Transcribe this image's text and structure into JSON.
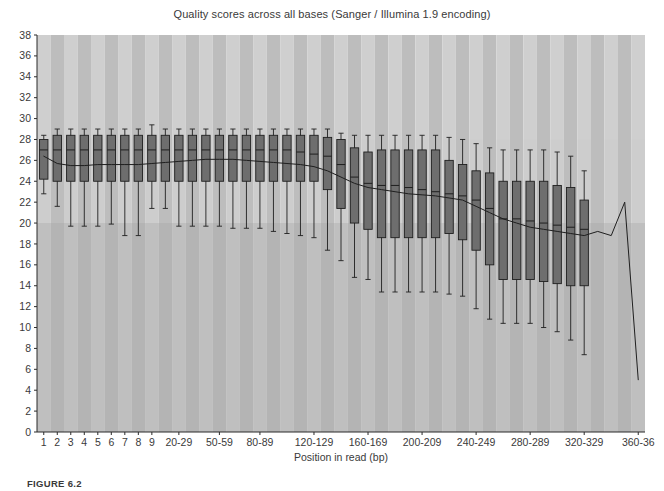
{
  "figure": {
    "caption": "FIGURE 6.2"
  },
  "chart_data": {
    "type": "bar",
    "subtype": "boxplot",
    "title": "Quality scores across all bases (Sanger / Illumina 1.9 encoding)",
    "xlabel": "Position in read (bp)",
    "ylabel": "",
    "ylim": [
      0,
      38
    ],
    "yticks": [
      0,
      2,
      4,
      6,
      8,
      10,
      12,
      14,
      16,
      18,
      20,
      22,
      24,
      26,
      28,
      30,
      32,
      34,
      36,
      38
    ],
    "grid": false,
    "legend": "none",
    "background_bands": [
      {
        "name": "good-quality-band",
        "from": 28,
        "to": 38,
        "color": "#d2d2d2"
      },
      {
        "name": "medium-quality-band",
        "from": 20,
        "to": 28,
        "color": "#c6c6c6"
      },
      {
        "name": "poor-quality-band",
        "from": 0,
        "to": 20,
        "color": "#a8a8a8"
      }
    ],
    "column_stripe_colors": [
      "#cfcfcf",
      "#bdbdbd"
    ],
    "box_fill_color": "#6e6e6e",
    "box_line_color": "#1f1f1f",
    "mean_line_color": "#1f1f1f",
    "categories": [
      "1",
      "2",
      "3",
      "4",
      "5",
      "6",
      "7",
      "8",
      "9",
      "10-19",
      "20-29",
      "30-39",
      "40-49",
      "50-59",
      "60-69",
      "70-79",
      "80-89",
      "90-99",
      "100-109",
      "110-119",
      "120-129",
      "130-139",
      "140-149",
      "150-159",
      "160-169",
      "170-179",
      "180-189",
      "190-199",
      "200-209",
      "210-219",
      "220-229",
      "230-239",
      "240-249",
      "250-259",
      "260-269",
      "270-279",
      "280-289",
      "290-299",
      "300-309",
      "310-319",
      "320-329",
      "330-339",
      "340-349",
      "350-359",
      "360-36"
    ],
    "xtick_labels": [
      {
        "category": "1",
        "label": "1"
      },
      {
        "category": "2",
        "label": "2"
      },
      {
        "category": "3",
        "label": "3"
      },
      {
        "category": "4",
        "label": "4"
      },
      {
        "category": "5",
        "label": "5"
      },
      {
        "category": "6",
        "label": "6"
      },
      {
        "category": "7",
        "label": "7"
      },
      {
        "category": "8",
        "label": "8"
      },
      {
        "category": "9",
        "label": "9"
      },
      {
        "category": "20-29",
        "label": "20-29"
      },
      {
        "category": "50-59",
        "label": "50-59"
      },
      {
        "category": "80-89",
        "label": "80-89"
      },
      {
        "category": "120-129",
        "label": "120-129"
      },
      {
        "category": "160-169",
        "label": "160-169"
      },
      {
        "category": "200-209",
        "label": "200-209"
      },
      {
        "category": "240-249",
        "label": "240-249"
      },
      {
        "category": "280-289",
        "label": "280-289"
      },
      {
        "category": "320-329",
        "label": "320-329"
      },
      {
        "category": "360-36",
        "label": "360-36"
      }
    ],
    "boxes": [
      {
        "category": "1",
        "lower_whisker": 22.8,
        "q1": 24.2,
        "median": 27.0,
        "q3": 28.0,
        "upper_whisker": 28.4
      },
      {
        "category": "2",
        "lower_whisker": 21.6,
        "q1": 24.0,
        "median": 27.0,
        "q3": 28.4,
        "upper_whisker": 29.0
      },
      {
        "category": "3",
        "lower_whisker": 19.7,
        "q1": 24.0,
        "median": 27.0,
        "q3": 28.4,
        "upper_whisker": 29.0
      },
      {
        "category": "4",
        "lower_whisker": 19.7,
        "q1": 24.0,
        "median": 27.0,
        "q3": 28.4,
        "upper_whisker": 29.0
      },
      {
        "category": "5",
        "lower_whisker": 19.7,
        "q1": 24.0,
        "median": 27.0,
        "q3": 28.4,
        "upper_whisker": 29.0
      },
      {
        "category": "6",
        "lower_whisker": 19.9,
        "q1": 24.0,
        "median": 27.0,
        "q3": 28.4,
        "upper_whisker": 29.0
      },
      {
        "category": "7",
        "lower_whisker": 18.8,
        "q1": 24.0,
        "median": 27.0,
        "q3": 28.4,
        "upper_whisker": 29.0
      },
      {
        "category": "8",
        "lower_whisker": 18.8,
        "q1": 24.0,
        "median": 27.0,
        "q3": 28.4,
        "upper_whisker": 29.0
      },
      {
        "category": "9",
        "lower_whisker": 21.4,
        "q1": 24.0,
        "median": 27.0,
        "q3": 28.4,
        "upper_whisker": 29.4
      },
      {
        "category": "10-19",
        "lower_whisker": 21.4,
        "q1": 24.0,
        "median": 27.0,
        "q3": 28.4,
        "upper_whisker": 29.0
      },
      {
        "category": "20-29",
        "lower_whisker": 19.7,
        "q1": 24.0,
        "median": 27.0,
        "q3": 28.4,
        "upper_whisker": 29.0
      },
      {
        "category": "30-39",
        "lower_whisker": 19.7,
        "q1": 24.0,
        "median": 27.0,
        "q3": 28.4,
        "upper_whisker": 29.0
      },
      {
        "category": "40-49",
        "lower_whisker": 19.7,
        "q1": 24.0,
        "median": 27.0,
        "q3": 28.4,
        "upper_whisker": 29.0
      },
      {
        "category": "50-59",
        "lower_whisker": 19.7,
        "q1": 24.0,
        "median": 27.0,
        "q3": 28.4,
        "upper_whisker": 29.0
      },
      {
        "category": "60-69",
        "lower_whisker": 19.5,
        "q1": 24.0,
        "median": 27.0,
        "q3": 28.4,
        "upper_whisker": 29.0
      },
      {
        "category": "70-79",
        "lower_whisker": 19.5,
        "q1": 24.0,
        "median": 27.0,
        "q3": 28.4,
        "upper_whisker": 29.0
      },
      {
        "category": "80-89",
        "lower_whisker": 19.5,
        "q1": 24.0,
        "median": 27.0,
        "q3": 28.4,
        "upper_whisker": 29.0
      },
      {
        "category": "90-99",
        "lower_whisker": 19.2,
        "q1": 24.0,
        "median": 27.0,
        "q3": 28.4,
        "upper_whisker": 29.0
      },
      {
        "category": "100-109",
        "lower_whisker": 19.0,
        "q1": 24.0,
        "median": 27.0,
        "q3": 28.4,
        "upper_whisker": 29.0
      },
      {
        "category": "110-119",
        "lower_whisker": 18.8,
        "q1": 24.0,
        "median": 26.8,
        "q3": 28.4,
        "upper_whisker": 29.0
      },
      {
        "category": "120-129",
        "lower_whisker": 18.6,
        "q1": 24.0,
        "median": 26.6,
        "q3": 28.4,
        "upper_whisker": 29.0
      },
      {
        "category": "130-139",
        "lower_whisker": 17.4,
        "q1": 23.2,
        "median": 26.4,
        "q3": 28.2,
        "upper_whisker": 29.0
      },
      {
        "category": "140-149",
        "lower_whisker": 16.4,
        "q1": 21.4,
        "median": 25.6,
        "q3": 28.0,
        "upper_whisker": 28.6
      },
      {
        "category": "150-159",
        "lower_whisker": 14.8,
        "q1": 20.0,
        "median": 24.4,
        "q3": 27.2,
        "upper_whisker": 28.4
      },
      {
        "category": "160-169",
        "lower_whisker": 14.6,
        "q1": 19.4,
        "median": 23.8,
        "q3": 26.8,
        "upper_whisker": 28.4
      },
      {
        "category": "170-179",
        "lower_whisker": 13.4,
        "q1": 18.6,
        "median": 23.6,
        "q3": 27.0,
        "upper_whisker": 28.4
      },
      {
        "category": "180-189",
        "lower_whisker": 13.4,
        "q1": 18.6,
        "median": 23.6,
        "q3": 27.0,
        "upper_whisker": 28.4
      },
      {
        "category": "190-199",
        "lower_whisker": 13.4,
        "q1": 18.6,
        "median": 23.4,
        "q3": 27.0,
        "upper_whisker": 28.4
      },
      {
        "category": "200-209",
        "lower_whisker": 13.4,
        "q1": 18.6,
        "median": 23.2,
        "q3": 27.0,
        "upper_whisker": 28.4
      },
      {
        "category": "210-219",
        "lower_whisker": 13.4,
        "q1": 18.6,
        "median": 23.0,
        "q3": 27.0,
        "upper_whisker": 28.4
      },
      {
        "category": "220-229",
        "lower_whisker": 13.2,
        "q1": 19.0,
        "median": 22.8,
        "q3": 26.0,
        "upper_whisker": 28.2
      },
      {
        "category": "230-239",
        "lower_whisker": 13.0,
        "q1": 18.4,
        "median": 22.6,
        "q3": 25.6,
        "upper_whisker": 28.0
      },
      {
        "category": "240-249",
        "lower_whisker": 11.8,
        "q1": 17.4,
        "median": 22.2,
        "q3": 25.0,
        "upper_whisker": 27.6
      },
      {
        "category": "250-259",
        "lower_whisker": 10.8,
        "q1": 16.0,
        "median": 21.4,
        "q3": 24.8,
        "upper_whisker": 27.2
      },
      {
        "category": "260-269",
        "lower_whisker": 10.4,
        "q1": 14.6,
        "median": 20.4,
        "q3": 24.0,
        "upper_whisker": 27.0
      },
      {
        "category": "270-279",
        "lower_whisker": 10.4,
        "q1": 14.6,
        "median": 20.4,
        "q3": 24.0,
        "upper_whisker": 27.0
      },
      {
        "category": "280-289",
        "lower_whisker": 10.4,
        "q1": 14.6,
        "median": 20.2,
        "q3": 24.0,
        "upper_whisker": 27.0
      },
      {
        "category": "290-299",
        "lower_whisker": 10.0,
        "q1": 14.4,
        "median": 20.0,
        "q3": 24.0,
        "upper_whisker": 27.0
      },
      {
        "category": "300-309",
        "lower_whisker": 9.6,
        "q1": 14.2,
        "median": 19.8,
        "q3": 23.6,
        "upper_whisker": 26.8
      },
      {
        "category": "310-319",
        "lower_whisker": 8.8,
        "q1": 14.0,
        "median": 19.6,
        "q3": 23.4,
        "upper_whisker": 26.4
      },
      {
        "category": "320-329",
        "lower_whisker": 7.4,
        "q1": 14.0,
        "median": 19.4,
        "q3": 22.2,
        "upper_whisker": 25.0
      }
    ],
    "mean_line": {
      "name": "mean-quality-line",
      "points": [
        {
          "category": "1",
          "value": 26.4
        },
        {
          "category": "2",
          "value": 25.7
        },
        {
          "category": "3",
          "value": 25.5
        },
        {
          "category": "4",
          "value": 25.5
        },
        {
          "category": "5",
          "value": 25.6
        },
        {
          "category": "6",
          "value": 25.6
        },
        {
          "category": "7",
          "value": 25.6
        },
        {
          "category": "8",
          "value": 25.6
        },
        {
          "category": "9",
          "value": 25.7
        },
        {
          "category": "10-19",
          "value": 25.8
        },
        {
          "category": "20-29",
          "value": 25.9
        },
        {
          "category": "30-39",
          "value": 26.0
        },
        {
          "category": "40-49",
          "value": 26.1
        },
        {
          "category": "50-59",
          "value": 26.1
        },
        {
          "category": "60-69",
          "value": 26.1
        },
        {
          "category": "70-79",
          "value": 26.0
        },
        {
          "category": "80-89",
          "value": 25.9
        },
        {
          "category": "90-99",
          "value": 25.8
        },
        {
          "category": "100-109",
          "value": 25.7
        },
        {
          "category": "110-119",
          "value": 25.6
        },
        {
          "category": "120-129",
          "value": 25.4
        },
        {
          "category": "130-139",
          "value": 25.0
        },
        {
          "category": "140-149",
          "value": 24.4
        },
        {
          "category": "150-159",
          "value": 23.8
        },
        {
          "category": "160-169",
          "value": 23.4
        },
        {
          "category": "170-179",
          "value": 23.2
        },
        {
          "category": "180-189",
          "value": 23.0
        },
        {
          "category": "190-199",
          "value": 22.8
        },
        {
          "category": "200-209",
          "value": 22.7
        },
        {
          "category": "210-219",
          "value": 22.6
        },
        {
          "category": "220-229",
          "value": 22.4
        },
        {
          "category": "230-239",
          "value": 22.2
        },
        {
          "category": "240-249",
          "value": 21.6
        },
        {
          "category": "250-259",
          "value": 21.0
        },
        {
          "category": "260-269",
          "value": 20.4
        },
        {
          "category": "270-279",
          "value": 20.0
        },
        {
          "category": "280-289",
          "value": 19.6
        },
        {
          "category": "290-299",
          "value": 19.4
        },
        {
          "category": "300-309",
          "value": 19.2
        },
        {
          "category": "310-319",
          "value": 19.0
        },
        {
          "category": "320-329",
          "value": 18.8
        },
        {
          "category": "330-339",
          "value": 19.2
        },
        {
          "category": "340-349",
          "value": 18.8
        },
        {
          "category": "350-359",
          "value": 22.0
        },
        {
          "category": "360-36",
          "value": 5.0
        }
      ]
    }
  }
}
